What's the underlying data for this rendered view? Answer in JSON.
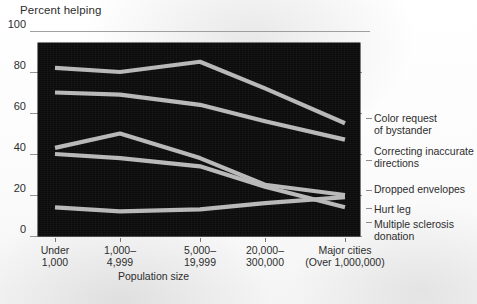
{
  "chart_data": {
    "type": "line",
    "title": "",
    "ylabel": "Percent helping",
    "xlabel": "Population size",
    "ylim": [
      0,
      100
    ],
    "yticks": [
      0,
      20,
      40,
      60,
      80,
      100
    ],
    "ytick_labels": [
      "0",
      "20",
      "40",
      "60",
      "80",
      "100"
    ],
    "grid": true,
    "legend_position": "right",
    "plot_background": "#0b0b0b",
    "line_color": "#b9b9b9",
    "categories": [
      "Under\n1,000",
      "1,000–\n4,999",
      "5,000–\n19,999",
      "20,000–\n300,000",
      "Major cities\n(Over 1,000,000)"
    ],
    "category_labels_line1": [
      "Under",
      "1,000–",
      "5,000–",
      "20,000–",
      "Major cities"
    ],
    "category_labels_line2": [
      "1,000",
      "4,999",
      "19,999",
      "300,000",
      "(Over 1,000,000)"
    ],
    "series": [
      {
        "name": "Color request\nof bystander",
        "label_line1": "Color request",
        "label_line2": "of bystander",
        "values": [
          82,
          80,
          85,
          72,
          55
        ]
      },
      {
        "name": "Correcting inaccurate\ndirections",
        "label_line1": "Correcting inaccurate",
        "label_line2": "directions",
        "values": [
          70,
          69,
          64,
          56,
          47
        ]
      },
      {
        "name": "Dropped envelopes",
        "label_line1": "Dropped envelopes",
        "label_line2": "",
        "values": [
          43,
          50,
          38,
          25,
          20
        ]
      },
      {
        "name": "Hurt leg",
        "label_line1": "Hurt leg",
        "label_line2": "",
        "values": [
          40,
          38,
          34,
          24,
          14
        ]
      },
      {
        "name": "Multiple sclerosis\ndonation",
        "label_line1": "Multiple sclerosis",
        "label_line2": "donation",
        "values": [
          14,
          12,
          13,
          16,
          19
        ]
      }
    ]
  },
  "axes": {
    "y_title": "Percent helping",
    "x_title": "Population size"
  }
}
